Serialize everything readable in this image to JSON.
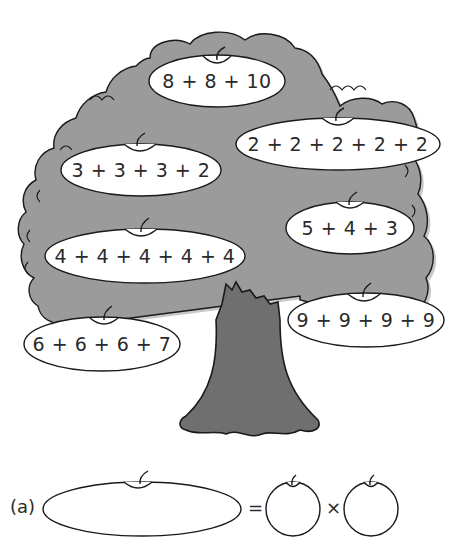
{
  "colors": {
    "canopy": "#9b9b9b",
    "canopy_shadow": "#c4c4c4",
    "trunk": "#6f6f6f",
    "outline": "#1a1a1a",
    "apple_fill": "#ffffff",
    "text": "#2a2a2a"
  },
  "tree": {
    "apples": [
      {
        "id": "apple-1",
        "expression": "8 + 8 + 10"
      },
      {
        "id": "apple-2",
        "expression": "2 + 2 + 2 + 2 + 2"
      },
      {
        "id": "apple-3",
        "expression": "3 + 3 + 3 + 2"
      },
      {
        "id": "apple-4",
        "expression": "5 + 4 + 3"
      },
      {
        "id": "apple-5",
        "expression": "4 + 4 + 4 + 4 + 4"
      },
      {
        "id": "apple-6",
        "expression": "9 + 9 + 9 + 9"
      },
      {
        "id": "apple-7",
        "expression": "6 + 6 + 6 + 7"
      }
    ]
  },
  "question": {
    "label": "(a)",
    "equals": "=",
    "times": "×",
    "answer_sum_blank": "",
    "factor1_blank": "",
    "factor2_blank": ""
  }
}
